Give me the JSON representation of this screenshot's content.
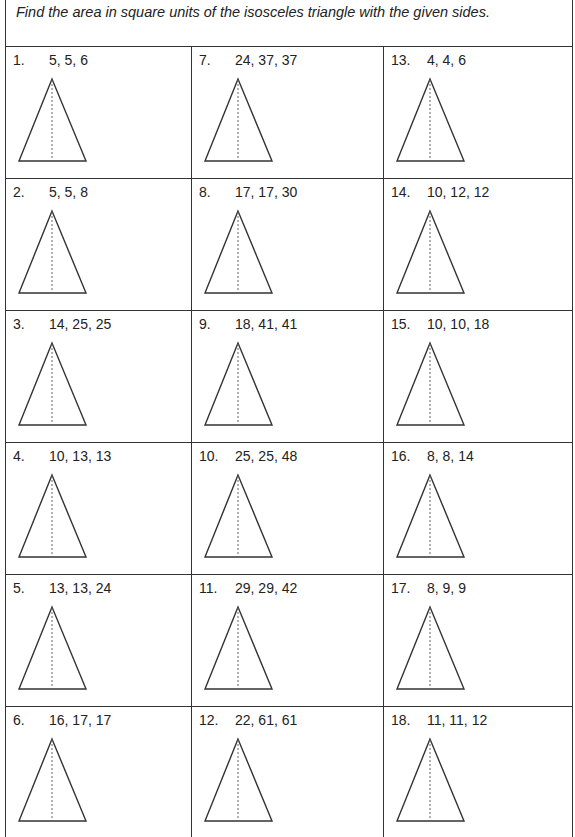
{
  "instructions": "Find the area in square units of the isosceles triangle with the given sides.",
  "problems": [
    [
      {
        "number": "1.",
        "sides": "5, 5, 6"
      },
      {
        "number": "7.",
        "sides": "24, 37, 37"
      },
      {
        "number": "13.",
        "sides": "4, 4, 6"
      }
    ],
    [
      {
        "number": "2.",
        "sides": "5, 5, 8"
      },
      {
        "number": "8.",
        "sides": "17, 17, 30"
      },
      {
        "number": "14.",
        "sides": "10, 12, 12"
      }
    ],
    [
      {
        "number": "3.",
        "sides": "14, 25, 25"
      },
      {
        "number": "9.",
        "sides": "18, 41, 41"
      },
      {
        "number": "15.",
        "sides": "10, 10, 18"
      }
    ],
    [
      {
        "number": "4.",
        "sides": "10, 13, 13"
      },
      {
        "number": "10.",
        "sides": "25, 25, 48"
      },
      {
        "number": "16.",
        "sides": "8, 8, 14"
      }
    ],
    [
      {
        "number": "5.",
        "sides": "13, 13, 24"
      },
      {
        "number": "11.",
        "sides": "29, 29, 42"
      },
      {
        "number": "17.",
        "sides": "8, 9, 9"
      }
    ],
    [
      {
        "number": "6.",
        "sides": "16, 17, 17"
      },
      {
        "number": "12.",
        "sides": "22, 61, 61"
      },
      {
        "number": "18.",
        "sides": "11, 11, 12"
      }
    ]
  ],
  "colors": {
    "line": "#333333",
    "text": "#222222"
  }
}
